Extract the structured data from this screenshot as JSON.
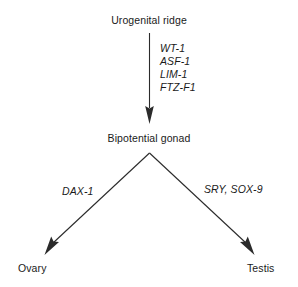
{
  "diagram": {
    "title_node": "Urogenital ridge",
    "middle_node": "Bipotential gonad",
    "left_terminal": "Ovary",
    "right_terminal": "Testis",
    "upper_genes": [
      "WT-1",
      "ASF-1",
      "LIM-1",
      "FTZ-F1"
    ],
    "left_branch_gene": "DAX-1",
    "right_branch_genes": "SRY, SOX-9",
    "colors": {
      "background": "#ffffff",
      "text": "#1a1a1a",
      "arrow": "#2b2b2b"
    }
  }
}
